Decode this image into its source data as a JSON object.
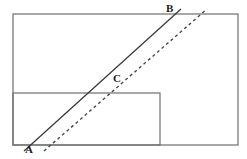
{
  "figure": {
    "canvas": {
      "width": 247,
      "height": 159,
      "background": "#ffffff"
    },
    "colors": {
      "outline": "#6e6e6e",
      "inner_outline": "#6e6e6e",
      "solid_line": "#3a3a3a",
      "dashed_line": "#4a4a4a",
      "label_text": "#1a1a1a"
    },
    "shapes": {
      "outer_rectangle": {
        "name": "outer-rectangle",
        "x": 13,
        "y": 14,
        "width": 225,
        "height": 131,
        "stroke_width": 1.2
      },
      "inner_rectangle": {
        "name": "inner-rectangle",
        "x": 13,
        "y": 93,
        "width": 147,
        "height": 52,
        "stroke_width": 1.2
      }
    },
    "lines": {
      "solid": {
        "name": "solid-transversal-line-AB",
        "x1": 24,
        "y1": 151,
        "x2": 181,
        "y2": 9,
        "stroke_width": 1.3,
        "style": "solid"
      },
      "dashed": {
        "name": "dashed-transversal-line",
        "x1": 44,
        "y1": 151,
        "x2": 207,
        "y2": 9,
        "stroke_width": 1.4,
        "style": "dashed",
        "dash_pattern": "3,3"
      }
    },
    "labels": {
      "a": "A",
      "b": "B",
      "c": "C"
    }
  }
}
